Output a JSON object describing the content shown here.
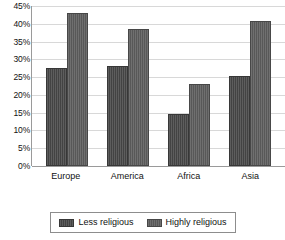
{
  "chart_data": {
    "type": "bar",
    "title": "",
    "xlabel": "",
    "ylabel": "",
    "categories": [
      "Europe",
      "America",
      "Africa",
      "Asia"
    ],
    "series": [
      {
        "name": "Less religious",
        "color": "#434343",
        "values": [
          27.6,
          28.0,
          14.7,
          25.4
        ]
      },
      {
        "name": "Highly religious",
        "color": "#585858",
        "values": [
          43.0,
          38.6,
          23.0,
          40.9
        ]
      }
    ],
    "ylim": [
      0,
      45
    ],
    "ytick_values": [
      45,
      40,
      35,
      30,
      25,
      20,
      15,
      10,
      5,
      0
    ],
    "ytick_labels": [
      "45%",
      "40%",
      "35%",
      "30%",
      "25%",
      "20%",
      "15%",
      "10%",
      "5%",
      "0%"
    ],
    "grid": true,
    "grid_axis": "y",
    "legend": true,
    "legend_position": "bottom",
    "legend_entries": [
      "Less religious",
      "Highly religious"
    ],
    "background_color": "#ffffff",
    "gridline_color": "#d8d8d8",
    "axis_color": "#9a9a9a"
  }
}
